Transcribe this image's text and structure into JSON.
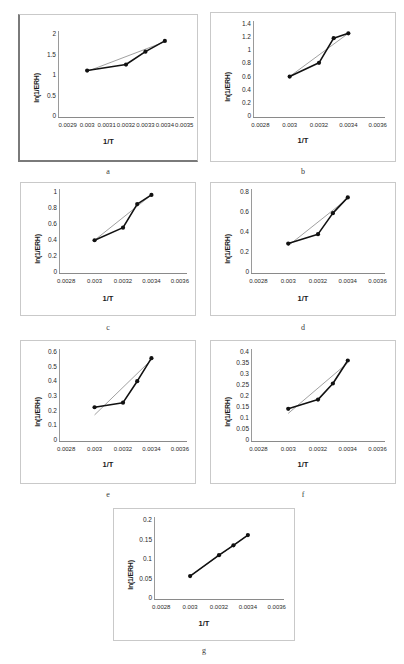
{
  "figure": {
    "panels": [
      {
        "id": "a",
        "caption": "a",
        "chart_data": {
          "type": "line",
          "title": "",
          "xlabel": "1/T",
          "ylabel": "ln(1/ERH)",
          "xticks": [
            "0.0029",
            "0.003",
            "0.0031",
            "0.0032",
            "0.0033",
            "0.0034",
            "0.0035"
          ],
          "xtick_values": [
            0.0029,
            0.003,
            0.0031,
            0.0032,
            0.0033,
            0.0034,
            0.0035
          ],
          "yticks": [
            "0",
            "0.5",
            "1",
            "1.5",
            "2"
          ],
          "ytick_values": [
            0,
            0.5,
            1,
            1.5,
            2
          ],
          "xlim": [
            0.00285,
            0.00355
          ],
          "ylim": [
            0,
            2
          ],
          "grid": false,
          "legend": "none",
          "series": [
            {
              "name": "ln(1/ERH)",
              "x": [
                0.003,
                0.0032,
                0.0033,
                0.0034
              ],
              "values": [
                1.08,
                1.22,
                1.52,
                1.77
              ]
            },
            {
              "name": "linear trend",
              "x": [
                0.003,
                0.0034
              ],
              "values": [
                1.06,
                1.75
              ]
            }
          ]
        }
      },
      {
        "id": "b",
        "caption": "b",
        "chart_data": {
          "type": "line",
          "title": "",
          "xlabel": "1/T",
          "ylabel": "ln(1/ERH)",
          "xticks": [
            "0.0028",
            "0.003",
            "0.0032",
            "0.0034",
            "0.0036"
          ],
          "xtick_values": [
            0.0028,
            0.003,
            0.0032,
            0.0034,
            0.0036
          ],
          "yticks": [
            "0",
            "0.2",
            "0.4",
            "0.6",
            "0.8",
            "1",
            "1.2",
            "1.4"
          ],
          "ytick_values": [
            0,
            0.2,
            0.4,
            0.6,
            0.8,
            1,
            1.2,
            1.4
          ],
          "xlim": [
            0.00275,
            0.00365
          ],
          "ylim": [
            0,
            1.4
          ],
          "grid": false,
          "legend": "none",
          "series": [
            {
              "name": "ln(1/ERH)",
              "x": [
                0.003,
                0.0032,
                0.0033,
                0.0034
              ],
              "values": [
                0.59,
                0.79,
                1.15,
                1.22
              ]
            },
            {
              "name": "linear trend",
              "x": [
                0.003,
                0.0034
              ],
              "values": [
                0.59,
                1.22
              ]
            }
          ]
        }
      },
      {
        "id": "c",
        "caption": "c",
        "chart_data": {
          "type": "line",
          "title": "",
          "xlabel": "1/T",
          "ylabel": "ln(1/ERH)",
          "xticks": [
            "0.0028",
            "0.003",
            "0.0032",
            "0.0034",
            "0.0036"
          ],
          "xtick_values": [
            0.0028,
            0.003,
            0.0032,
            0.0034,
            0.0036
          ],
          "yticks": [
            "0",
            "0.2",
            "0.4",
            "0.6",
            "0.8",
            "1"
          ],
          "ytick_values": [
            0,
            0.2,
            0.4,
            0.6,
            0.8,
            1
          ],
          "xlim": [
            0.00275,
            0.00365
          ],
          "ylim": [
            0,
            1
          ],
          "grid": false,
          "legend": "none",
          "series": [
            {
              "name": "ln(1/ERH)",
              "x": [
                0.003,
                0.0032,
                0.0033,
                0.0034
              ],
              "values": [
                0.39,
                0.54,
                0.82,
                0.93
              ]
            },
            {
              "name": "linear trend",
              "x": [
                0.003,
                0.0034
              ],
              "values": [
                0.39,
                0.93
              ]
            }
          ]
        }
      },
      {
        "id": "d",
        "caption": "d",
        "chart_data": {
          "type": "line",
          "title": "",
          "xlabel": "1/T",
          "ylabel": "ln(1/ERH)",
          "xticks": [
            "0.0028",
            "0.003",
            "0.0032",
            "0.0034",
            "0.0036"
          ],
          "xtick_values": [
            0.0028,
            0.003,
            0.0032,
            0.0034,
            0.0036
          ],
          "yticks": [
            "0",
            "0.2",
            "0.4",
            "0.6",
            "0.8"
          ],
          "ytick_values": [
            0,
            0.2,
            0.4,
            0.6,
            0.8
          ],
          "xlim": [
            0.00275,
            0.00365
          ],
          "ylim": [
            0,
            0.8
          ],
          "grid": false,
          "legend": "none",
          "series": [
            {
              "name": "ln(1/ERH)",
              "x": [
                0.003,
                0.0032,
                0.0033,
                0.0034
              ],
              "values": [
                0.28,
                0.37,
                0.57,
                0.72
              ]
            },
            {
              "name": "linear trend",
              "x": [
                0.003,
                0.0034
              ],
              "values": [
                0.26,
                0.71
              ]
            }
          ]
        }
      },
      {
        "id": "e",
        "caption": "e",
        "chart_data": {
          "type": "line",
          "title": "",
          "xlabel": "1/T",
          "ylabel": "ln(1/ERH)",
          "xticks": [
            "0.0028",
            "0.003",
            "0.0032",
            "0.0034",
            "0.0036"
          ],
          "xtick_values": [
            0.0028,
            0.003,
            0.0032,
            0.0034,
            0.0036
          ],
          "yticks": [
            "0",
            "0.1",
            "0.2",
            "0.3",
            "0.4",
            "0.5",
            "0.6"
          ],
          "ytick_values": [
            0,
            0.1,
            0.2,
            0.3,
            0.4,
            0.5,
            0.6
          ],
          "xlim": [
            0.00275,
            0.00365
          ],
          "ylim": [
            0,
            0.6
          ],
          "grid": false,
          "legend": "none",
          "series": [
            {
              "name": "ln(1/ERH)",
              "x": [
                0.003,
                0.0032,
                0.0033,
                0.0034
              ],
              "values": [
                0.22,
                0.25,
                0.39,
                0.54
              ]
            },
            {
              "name": "linear trend",
              "x": [
                0.003,
                0.0034
              ],
              "values": [
                0.17,
                0.53
              ]
            }
          ]
        }
      },
      {
        "id": "f",
        "caption": "f",
        "chart_data": {
          "type": "line",
          "title": "",
          "xlabel": "1/T",
          "ylabel": "ln(1/ERH)",
          "xticks": [
            "0.0028",
            "0.003",
            "0.0032",
            "0.0034",
            "0.0036"
          ],
          "xtick_values": [
            0.0028,
            0.003,
            0.0032,
            0.0034,
            0.0036
          ],
          "yticks": [
            "0",
            "0.05",
            "0.1",
            "0.15",
            "0.2",
            "0.25",
            "0.3",
            "0.35",
            "0.4"
          ],
          "ytick_values": [
            0,
            0.05,
            0.1,
            0.15,
            0.2,
            0.25,
            0.3,
            0.35,
            0.4
          ],
          "xlim": [
            0.00275,
            0.00365
          ],
          "ylim": [
            0,
            0.4
          ],
          "grid": false,
          "legend": "none",
          "series": [
            {
              "name": "ln(1/ERH)",
              "x": [
                0.003,
                0.0032,
                0.0033,
                0.0034
              ],
              "values": [
                0.14,
                0.18,
                0.25,
                0.35
              ]
            },
            {
              "name": "linear trend",
              "x": [
                0.003,
                0.0034
              ],
              "values": [
                0.12,
                0.34
              ]
            }
          ]
        }
      },
      {
        "id": "g",
        "caption": "g",
        "chart_data": {
          "type": "line",
          "title": "",
          "xlabel": "1/T",
          "ylabel": "ln(1/ERH)",
          "xticks": [
            "0.0028",
            "0.003",
            "0.0032",
            "0.0034",
            "0.0036"
          ],
          "xtick_values": [
            0.0028,
            0.003,
            0.0032,
            0.0034,
            0.0036
          ],
          "yticks": [
            "0",
            "0.05",
            "0.1",
            "0.15",
            "0.2"
          ],
          "ytick_values": [
            0,
            0.05,
            0.1,
            0.15,
            0.2
          ],
          "xlim": [
            0.00275,
            0.00365
          ],
          "ylim": [
            0,
            0.2
          ],
          "grid": false,
          "legend": "none",
          "series": [
            {
              "name": "ln(1/ERH)",
              "x": [
                0.003,
                0.0032,
                0.0033,
                0.0034
              ],
              "values": [
                0.056,
                0.107,
                0.131,
                0.156
              ]
            },
            {
              "name": "linear trend",
              "x": [
                0.003,
                0.0034
              ],
              "values": [
                0.056,
                0.156
              ]
            }
          ]
        }
      }
    ]
  }
}
